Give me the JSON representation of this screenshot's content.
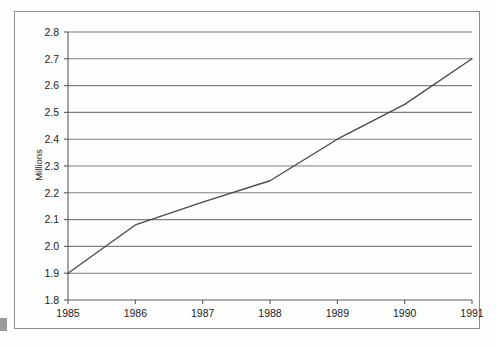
{
  "chart_data": {
    "type": "line",
    "title": "",
    "subtitle": "",
    "xlabel": "",
    "ylabel": "Millions",
    "x": [
      1985,
      1986,
      1987,
      1988,
      1989,
      1990,
      1991
    ],
    "categories": [
      "1985",
      "1986",
      "1987",
      "1988",
      "1989",
      "1990",
      "1991"
    ],
    "values": [
      1.9,
      2.08,
      2.165,
      2.245,
      2.4,
      2.53,
      2.7
    ],
    "series": [
      {
        "name": "",
        "values": [
          1.9,
          2.08,
          2.165,
          2.245,
          2.4,
          2.53,
          2.7
        ]
      }
    ],
    "xlim": [
      1985,
      1991
    ],
    "ylim": [
      1.8,
      2.8
    ],
    "ytick_labels": [
      "2.8",
      "2.7",
      "2.6",
      "2.5",
      "2.4",
      "2.3",
      "2.2",
      "2.1",
      "2.0",
      "1.9",
      "1.8"
    ],
    "ytick_values": [
      2.8,
      2.7,
      2.6,
      2.5,
      2.4,
      2.3,
      2.2,
      2.1,
      2.0,
      1.9,
      1.8
    ],
    "xtick_labels": [
      "1985",
      "1986",
      "1987",
      "1988",
      "1989",
      "1990",
      "1991"
    ],
    "grid": "horizontal",
    "legend": "none",
    "annotations": [],
    "colors": {
      "line": "#4a4a4a",
      "gridline": "#7f7f7f",
      "axis": "#5a5a5a",
      "frame": "#8d8d8d",
      "text": "#1b1b1b",
      "background": "#fefefe"
    }
  }
}
